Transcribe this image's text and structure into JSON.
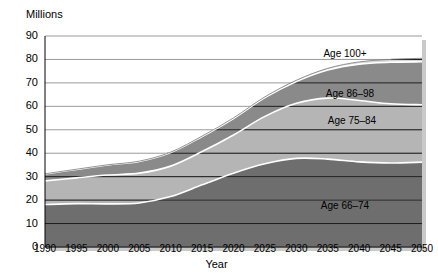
{
  "chart_data": {
    "type": "area",
    "title": "",
    "ylabel": "Millions",
    "xlabel": "Year",
    "grid": true,
    "legend_position": "inline-labels",
    "stacked": true,
    "x": [
      1990,
      1995,
      2000,
      2005,
      2010,
      2015,
      2020,
      2025,
      2030,
      2035,
      2040,
      2045,
      2050
    ],
    "xtick_labels": [
      "1990",
      "1995",
      "2000",
      "2005",
      "2010",
      "2015",
      "2020",
      "2025",
      "2030",
      "2035",
      "2040",
      "2045",
      "2050"
    ],
    "ytick_labels": [
      "0",
      "10",
      "20",
      "30",
      "40",
      "50",
      "60",
      "70",
      "80",
      "90"
    ],
    "xlim": [
      1990,
      2050
    ],
    "ylim": [
      0,
      90
    ],
    "series": [
      {
        "name": "Age 65–74",
        "label": "Age 65–74",
        "color": "#6e6e6e",
        "values": [
          18.1,
          18.5,
          18.4,
          18.8,
          21.5,
          26.5,
          31.5,
          35.5,
          37.8,
          37.5,
          36.3,
          35.8,
          36.2
        ]
      },
      {
        "name": "Age 75–84",
        "label": "Age 75–84",
        "color": "#b5b5b5",
        "values": [
          10.1,
          11.0,
          12.3,
          12.7,
          13.0,
          14.2,
          16.3,
          20.2,
          23.5,
          26.0,
          26.2,
          25.3,
          24.5
        ]
      },
      {
        "name": "Age 85–99",
        "label": "Age 86–98",
        "color": "#8a8a8a",
        "values": [
          3.0,
          3.6,
          4.3,
          5.0,
          5.8,
          6.4,
          7.0,
          8.0,
          9.3,
          12.0,
          15.5,
          17.7,
          18.3
        ]
      },
      {
        "name": "Age 100+",
        "label": "Age 100+",
        "color": "#d8d8d8",
        "values": [
          0.04,
          0.06,
          0.08,
          0.11,
          0.15,
          0.2,
          0.27,
          0.35,
          0.5,
          0.7,
          0.95,
          1.2,
          1.5
        ]
      }
    ],
    "series_label_positions": [
      {
        "label": "Age 100+",
        "x": 345,
        "y": 48
      },
      {
        "label": "Age 86–98",
        "x": 350,
        "y": 88
      },
      {
        "label": "Age 75–84",
        "x": 352,
        "y": 115
      },
      {
        "label": "Age 66–74",
        "x": 345,
        "y": 200
      }
    ]
  },
  "style": {
    "gridline_color": "#000000",
    "axis_color": "#000000",
    "plot_background": "#ffffff",
    "boundary_line_color": "#ffffff"
  }
}
